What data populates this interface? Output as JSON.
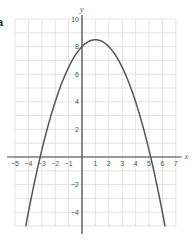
{
  "part_label": "a",
  "chart_data": {
    "type": "line",
    "title": "",
    "xlabel": "x",
    "ylabel": "y",
    "xlim": [
      -5,
      7
    ],
    "ylim": [
      -5,
      10
    ],
    "grid": true,
    "grid_step": 1,
    "x_ticks": [
      -5,
      -4,
      -3,
      -2,
      -1,
      1,
      2,
      3,
      4,
      5,
      6,
      7
    ],
    "y_ticks": [
      -4,
      -2,
      2,
      4,
      6,
      8,
      10
    ],
    "series": [
      {
        "name": "y = -0.5x^2 + x + 8",
        "equation": "y = -0.5x^2 + x + 8",
        "vertex": [
          1,
          8.5
        ],
        "y_intercept": 8,
        "x_intercepts": [
          -3.12,
          5.12
        ],
        "x": [
          -4.2,
          -4,
          -3,
          -2,
          -1,
          0,
          1,
          2,
          3,
          4,
          5,
          6,
          6.2
        ],
        "values": [
          -5,
          -4,
          2.5,
          4,
          6.5,
          8,
          8.5,
          8,
          6.5,
          4,
          0.5,
          -4,
          -5
        ]
      }
    ]
  },
  "colors": {
    "grid": "#dcdcdc",
    "axis": "#444444",
    "curve": "#555555",
    "tick_text": "#555555"
  }
}
